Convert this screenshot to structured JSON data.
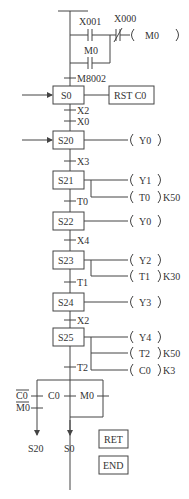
{
  "ladder": {
    "contact_x001": "X001",
    "contact_x000": "X000",
    "contact_m0": "M0",
    "coil_m0": "M0",
    "transition_m8002": "M8002"
  },
  "steps": [
    {
      "id": "S0",
      "action": "RST C0",
      "transitions_below": [
        "X2",
        "X0"
      ]
    },
    {
      "id": "S20",
      "outputs": [
        {
          "coil": "Y0"
        }
      ],
      "transition_below": "X3"
    },
    {
      "id": "S21",
      "outputs": [
        {
          "coil": "Y1"
        },
        {
          "coil": "T0",
          "k": "K50"
        }
      ],
      "transition_below": "T0"
    },
    {
      "id": "S22",
      "outputs": [
        {
          "coil": "Y0"
        }
      ],
      "transition_below": "X4"
    },
    {
      "id": "S23",
      "outputs": [
        {
          "coil": "Y2"
        },
        {
          "coil": "T1",
          "k": "K30"
        }
      ],
      "transition_below": "T1"
    },
    {
      "id": "S24",
      "outputs": [
        {
          "coil": "Y3"
        }
      ],
      "transition_below": "X2"
    },
    {
      "id": "S25",
      "outputs": [
        {
          "coil": "Y4"
        },
        {
          "coil": "T2",
          "k": "K50"
        },
        {
          "coil": "C0",
          "k": "K3"
        }
      ],
      "transition_below": "T2"
    }
  ],
  "branches": {
    "left_cond_1": "C0",
    "left_cond_2": "M0",
    "middle_cond": "C0",
    "right_cond": "M0",
    "jump_left": "S20",
    "jump_middle": "S0"
  },
  "end_blocks": {
    "ret": "RET",
    "end": "END"
  },
  "colors": {
    "line": "#444444",
    "text": "#333333",
    "background": "#ffffff"
  }
}
